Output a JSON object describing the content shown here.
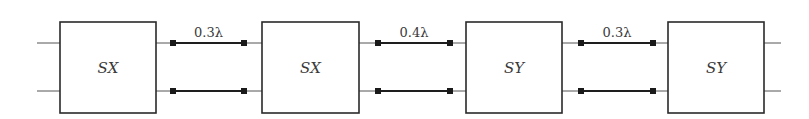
{
  "diagram": {
    "type": "cascaded two-port network",
    "blocks": [
      {
        "label": "SX",
        "x": 60,
        "y": 22,
        "w": 96,
        "h": 91
      },
      {
        "label": "SX",
        "x": 262,
        "y": 22,
        "w": 97,
        "h": 91
      },
      {
        "label": "SY",
        "x": 466,
        "y": 22,
        "w": 96,
        "h": 91
      },
      {
        "label": "SY",
        "x": 668,
        "y": 22,
        "w": 96,
        "h": 91
      }
    ],
    "ports_y": [
      43,
      91
    ],
    "input_stub": {
      "x1": 37,
      "x2": 60
    },
    "output_stub": {
      "x1": 764,
      "x2": 781
    },
    "transmission_lines": [
      {
        "label": "0.3λ",
        "from_x": 156,
        "to_x": 262,
        "marker_left": 173,
        "marker_right": 244
      },
      {
        "label": "0.4λ",
        "from_x": 359,
        "to_x": 466,
        "marker_left": 378,
        "marker_right": 450
      },
      {
        "label": "0.3λ",
        "from_x": 562,
        "to_x": 668,
        "marker_left": 581,
        "marker_right": 653
      }
    ]
  }
}
